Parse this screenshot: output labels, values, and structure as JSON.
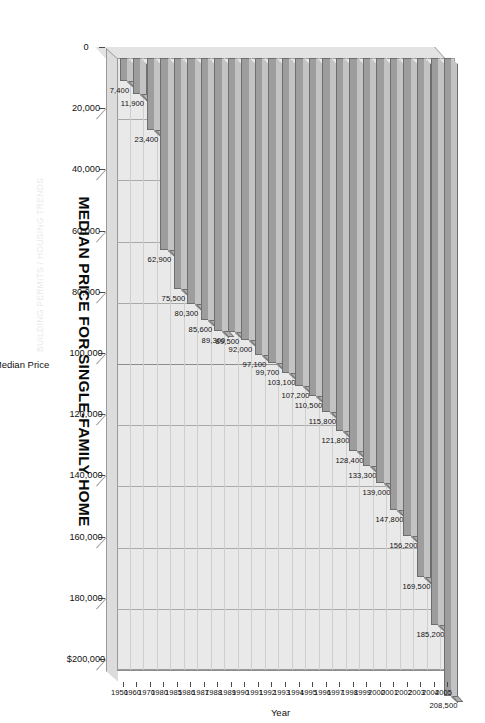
{
  "header_note": "BUILDING PERMITS / HOUSING TRENDS",
  "chart_data": {
    "type": "bar",
    "orientation": "horizontal-3d",
    "title": "MEDIAN PRICE FOR SINGLE-FAMILY HOME",
    "xlabel": "Median Price",
    "ylabel": "Year",
    "xlim": [
      0,
      200000
    ],
    "xticks": [
      0,
      20000,
      40000,
      60000,
      80000,
      100000,
      120000,
      140000,
      160000,
      180000,
      200000
    ],
    "xtick_labels": [
      "0",
      "20,000",
      "40,000",
      "60,000",
      "80,000",
      "100,000",
      "120,000",
      "140,000",
      "160,000",
      "180,000",
      "$200,000"
    ],
    "grid": true,
    "legend": "none",
    "bar_color": "#9d9d9d",
    "plot_background": "#e9e9e9",
    "categories": [
      "1950",
      "1960",
      "1970",
      "1980",
      "1985",
      "1986",
      "1987",
      "1988",
      "1989",
      "1990",
      "1991",
      "1992",
      "1993",
      "1994",
      "1995",
      "1996",
      "1997",
      "1998",
      "1999",
      "2000",
      "2001",
      "2002",
      "2003",
      "2004",
      "2005"
    ],
    "values": [
      7400,
      11900,
      23400,
      62900,
      75500,
      80300,
      85600,
      89300,
      89500,
      92000,
      97100,
      99700,
      103100,
      107200,
      110500,
      115800,
      121800,
      128400,
      133300,
      139000,
      147800,
      156200,
      169500,
      185200,
      208500
    ],
    "value_labels": [
      "7,400",
      "11,900",
      "23,400",
      "62,900",
      "75,500",
      "80,300",
      "85,600",
      "89,300",
      "89,500",
      "92,000",
      "97,100",
      "99,700",
      "103,100",
      "107,200",
      "110,500",
      "115,800",
      "121,800",
      "128,400",
      "133,300",
      "139,000",
      "147,800",
      "156,200",
      "169,500",
      "185,200",
      "208,500"
    ]
  }
}
